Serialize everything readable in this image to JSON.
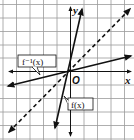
{
  "diagram": {
    "type": "function-inverse-graph",
    "grid": {
      "columns": 10,
      "rows": 10,
      "color": "#9a9a9a"
    },
    "axes": {
      "x_label": "x",
      "y_label": "y",
      "origin_label": "O",
      "color": "#111111"
    },
    "lines": [
      {
        "id": "f",
        "label": "f(x)",
        "style": "solid",
        "slope": 4,
        "color": "#111111"
      },
      {
        "id": "f_inverse",
        "label": "f⁻¹(x)",
        "style": "solid",
        "slope": 0.25,
        "color": "#111111"
      },
      {
        "id": "identity",
        "label": "y = x",
        "style": "dashed",
        "slope": 1,
        "color": "#111111"
      }
    ]
  },
  "labels": {
    "f": "f(x)",
    "f_inverse": "f⁻¹(x)",
    "x_axis": "x",
    "y_axis": "y",
    "origin": "O"
  }
}
